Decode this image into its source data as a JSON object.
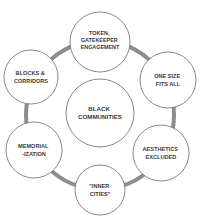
{
  "diagram": {
    "type": "hub-and-ring",
    "colors": {
      "ring": "#8c8c8c",
      "node_fill": "#ffffff",
      "node_stroke": "#6b6b6b",
      "text": "#3a3a3a",
      "background": "#ffffff"
    },
    "center": {
      "lines": [
        "BLACK",
        "COMMUNITIES"
      ]
    },
    "nodes": [
      {
        "id": "token",
        "lines": [
          "TOKEN,",
          "GATEKEEPER",
          "ENGAGEMENT"
        ]
      },
      {
        "id": "one-size",
        "lines": [
          "ONE SIZE",
          "FITS ALL"
        ]
      },
      {
        "id": "aesthetics",
        "lines": [
          "AESTHETICS",
          "EXCLUDED"
        ]
      },
      {
        "id": "inner-cities",
        "lines": [
          "\"INNER",
          "CITIES\""
        ]
      },
      {
        "id": "memorialization",
        "lines": [
          "MEMORIAL",
          "-IZATION"
        ]
      },
      {
        "id": "blocks",
        "lines": [
          "BLOCKS &",
          "CORRIDORS"
        ]
      }
    ]
  }
}
